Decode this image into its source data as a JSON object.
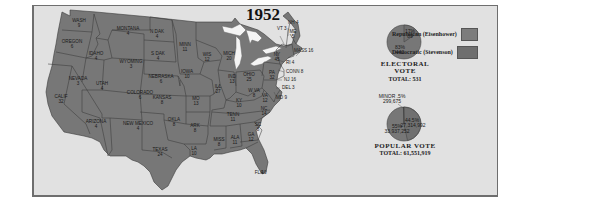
{
  "title": "1952",
  "colors": {
    "republican": "#7a7a7a",
    "democratic": "#707070",
    "frame_bg": "#e1e1e1",
    "water": "#f6f6f6",
    "state_border": "#3a3a3a"
  },
  "legend": {
    "items": [
      {
        "label": "Republican (Eisenhower)",
        "color": "#7c7c7c"
      },
      {
        "label": "Democratic (Stevenson)",
        "color": "#6e6e6e"
      }
    ]
  },
  "electoral_vote": {
    "title": "ELECTORAL VOTE",
    "total_label": "TOTAL: 531",
    "republican_pct": "83%",
    "republican_votes": "442",
    "democratic_pct": "17%",
    "democratic_votes": "89"
  },
  "popular_vote": {
    "title": "POPULAR VOTE",
    "total_label": "TOTAL: 61,551,919",
    "minor_pct": "MINOR .5%",
    "minor_votes": "299,675",
    "republican_pct": "55%",
    "republican_votes": "33,937,252",
    "democratic_pct": "44.5%",
    "democratic_votes": "27,314,992"
  },
  "states": [
    {
      "name": "WASH",
      "ev": "9"
    },
    {
      "name": "OREGON",
      "ev": "6"
    },
    {
      "name": "CALIF",
      "ev": "32"
    },
    {
      "name": "IDAHO",
      "ev": "4"
    },
    {
      "name": "NEVADA",
      "ev": "3"
    },
    {
      "name": "MONTANA",
      "ev": "4"
    },
    {
      "name": "WYOMING",
      "ev": "3"
    },
    {
      "name": "UTAH",
      "ev": "4"
    },
    {
      "name": "ARIZONA",
      "ev": "4"
    },
    {
      "name": "COLORADO",
      "ev": "6"
    },
    {
      "name": "NEW MEXICO",
      "ev": "4"
    },
    {
      "name": "N DAK",
      "ev": "4"
    },
    {
      "name": "S DAK",
      "ev": "4"
    },
    {
      "name": "NEBRASKA",
      "ev": "6"
    },
    {
      "name": "KANSAS",
      "ev": "8"
    },
    {
      "name": "OKLA",
      "ev": "8"
    },
    {
      "name": "TEXAS",
      "ev": "24"
    },
    {
      "name": "MINN",
      "ev": "11"
    },
    {
      "name": "IOWA",
      "ev": "10"
    },
    {
      "name": "MO",
      "ev": "13"
    },
    {
      "name": "ARK",
      "ev": "8"
    },
    {
      "name": "LA",
      "ev": "10"
    },
    {
      "name": "WIS",
      "ev": "12"
    },
    {
      "name": "ILL",
      "ev": "27"
    },
    {
      "name": "MICH",
      "ev": "20"
    },
    {
      "name": "IND",
      "ev": "13"
    },
    {
      "name": "OHIO",
      "ev": "25"
    },
    {
      "name": "KY",
      "ev": "10"
    },
    {
      "name": "TENN",
      "ev": "11"
    },
    {
      "name": "MISS",
      "ev": "8"
    },
    {
      "name": "ALA",
      "ev": "11"
    },
    {
      "name": "GA",
      "ev": "12"
    },
    {
      "name": "FLA",
      "ev": "10"
    },
    {
      "name": "SC",
      "ev": "8"
    },
    {
      "name": "NC",
      "ev": "14"
    },
    {
      "name": "VA",
      "ev": "12"
    },
    {
      "name": "W VA",
      "ev": "8"
    },
    {
      "name": "PA",
      "ev": "32"
    },
    {
      "name": "NY",
      "ev": "45"
    },
    {
      "name": "VT",
      "ev": "3"
    },
    {
      "name": "NH",
      "ev": "4"
    },
    {
      "name": "ME",
      "ev": "5"
    },
    {
      "name": "MASS",
      "ev": "16"
    },
    {
      "name": "RI",
      "ev": "4"
    },
    {
      "name": "CONN",
      "ev": "8"
    },
    {
      "name": "NJ",
      "ev": "16"
    },
    {
      "name": "DEL",
      "ev": "3"
    },
    {
      "name": "MD",
      "ev": "9"
    }
  ],
  "outside_labels": {
    "vt": "VT 3",
    "nh": "NH 4",
    "mass": "MASS 16",
    "ri": "RI 4",
    "conn": "CONN 8",
    "nj": "NJ 16",
    "del": "DEL 3",
    "md": "MD 9"
  }
}
